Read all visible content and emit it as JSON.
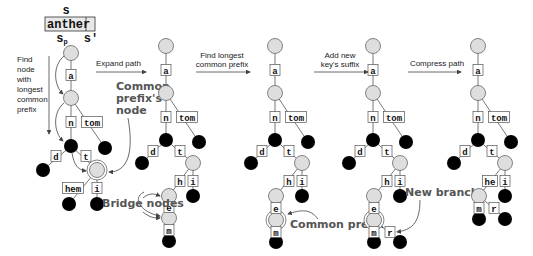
{
  "key": {
    "top_label": "s",
    "text": "anther",
    "split_left": "s",
    "split_left_sub": "p",
    "split_right": "s'"
  },
  "steps": [
    {
      "label": "Find node with longest common prefix"
    },
    {
      "label": "Expand path"
    },
    {
      "label": "Find longest common prefix"
    },
    {
      "label": "Add new key's suffix"
    },
    {
      "label": "Compress path"
    }
  ],
  "step_lines": {
    "find_node": [
      "Find",
      "node",
      "with",
      "longest",
      "common",
      "prefix"
    ],
    "lcp": [
      "Find longest",
      "common prefix"
    ],
    "suffix": [
      "Add new",
      "key's suffix"
    ]
  },
  "callouts": {
    "common_prefix_node": [
      "Common",
      "prefix's",
      "node"
    ],
    "bridge_nodes": "Bridge nodes",
    "common_prefix": "Common prefix",
    "new_branch": "New branch"
  },
  "edges": {
    "a": "a",
    "n": "n",
    "tom": "tom",
    "d": "d",
    "t": "t",
    "hem": "hem",
    "i": "i",
    "h": "h",
    "e": "e",
    "m": "m",
    "r": "r",
    "he": "he"
  },
  "colors": {
    "internal_node": "#dedede",
    "leaf_node": "#000000",
    "stroke": "#555555",
    "callout_text": "#555555"
  }
}
